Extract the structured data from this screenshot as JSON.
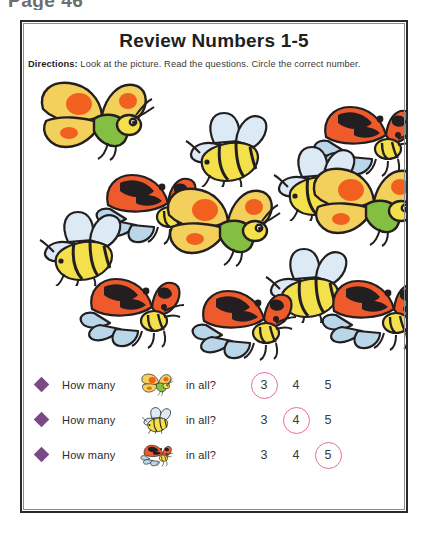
{
  "page": {
    "header_text": "Page 46",
    "background_color": "#ffffff",
    "frame_color": "#2a2a2a"
  },
  "worksheet": {
    "title": "Review Numbers 1-5",
    "directions_label": "Directions:",
    "directions_text": "Look at the picture. Read the questions. Circle the correct number.",
    "accent_colors": {
      "bullet_purple": "#7b4a86",
      "circle_pink": "#e86aa0",
      "butterfly_yellow": "#f5d householder",
      "bee_yellow": "#f2e13c",
      "ladybug_red": "#ef5a2c"
    }
  },
  "picture": {
    "counts": {
      "butterfly": 3,
      "bee": 4,
      "ladybug": 5
    },
    "items": [
      {
        "kind": "butterfly",
        "x": 14,
        "y": 6,
        "scale": 1.0,
        "flip": false
      },
      {
        "kind": "bee",
        "x": 158,
        "y": 36,
        "scale": 1.0,
        "flip": false
      },
      {
        "kind": "ladybug",
        "x": 290,
        "y": 24,
        "scale": 1.0,
        "flip": false
      },
      {
        "kind": "ladybug",
        "x": 72,
        "y": 92,
        "scale": 1.0,
        "flip": false
      },
      {
        "kind": "bee",
        "x": 246,
        "y": 70,
        "scale": 1.0,
        "flip": false
      },
      {
        "kind": "butterfly",
        "x": 140,
        "y": 112,
        "scale": 1.0,
        "flip": false
      },
      {
        "kind": "butterfly",
        "x": 286,
        "y": 92,
        "scale": 1.0,
        "flip": false
      },
      {
        "kind": "bee",
        "x": 12,
        "y": 135,
        "scale": 1.0,
        "flip": false
      },
      {
        "kind": "bee",
        "x": 238,
        "y": 172,
        "scale": 1.0,
        "flip": false
      },
      {
        "kind": "ladybug",
        "x": 56,
        "y": 196,
        "scale": 1.0,
        "flip": false
      },
      {
        "kind": "ladybug",
        "x": 168,
        "y": 208,
        "scale": 1.0,
        "flip": false
      },
      {
        "kind": "ladybug",
        "x": 298,
        "y": 198,
        "scale": 1.0,
        "flip": false
      }
    ]
  },
  "questions": [
    {
      "bullet": "diamond",
      "text": "How many",
      "icon": "butterfly-icon",
      "suffix": "in all?",
      "choices": [
        "3",
        "4",
        "5"
      ],
      "answer": "3"
    },
    {
      "bullet": "diamond",
      "text": "How many",
      "icon": "bee-icon",
      "suffix": "in all?",
      "choices": [
        "3",
        "4",
        "5"
      ],
      "answer": "4"
    },
    {
      "bullet": "diamond",
      "text": "How many",
      "icon": "ladybug-icon",
      "suffix": "in all?",
      "choices": [
        "3",
        "4",
        "5"
      ],
      "answer": "5"
    }
  ]
}
